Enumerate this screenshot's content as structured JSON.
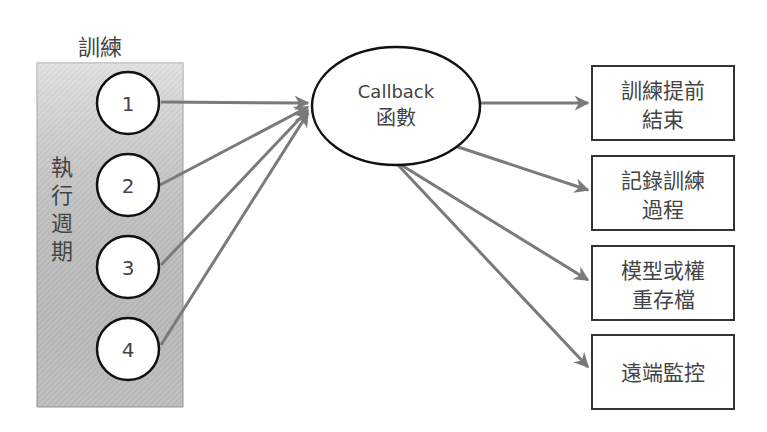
{
  "training_label": "訓練",
  "cycle_label": [
    "執",
    "行",
    "週",
    "期"
  ],
  "steps": [
    "1",
    "2",
    "3",
    "4"
  ],
  "callback": {
    "line1": "Callback",
    "line2": "函數"
  },
  "outputs": [
    {
      "line1": "訓練提前",
      "line2": "結束"
    },
    {
      "line1": "記錄訓練",
      "line2": "過程"
    },
    {
      "line1": "模型或權",
      "line2": "重存檔"
    },
    {
      "line1": "遠端監控",
      "line2": ""
    }
  ],
  "colors": {
    "arrow": "#7a7a7a",
    "panel": "#c8c8c8",
    "border": "#222222"
  }
}
